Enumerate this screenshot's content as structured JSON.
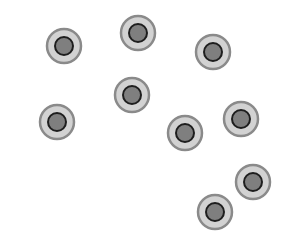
{
  "canvas": {
    "width": 281,
    "height": 238,
    "background": "#ffffff"
  },
  "style": {
    "outer_radius": 17,
    "outer_fill": "#d2d2d2",
    "outer_stroke": "#8a8a8a",
    "outer_stroke_width": 2.5,
    "inner_radius": 9,
    "inner_fill": "#7f7f7f",
    "inner_stroke": "#1e1e1e",
    "inner_stroke_width": 2
  },
  "circles": [
    {
      "id": 1,
      "x": 64,
      "y": 46
    },
    {
      "id": 2,
      "x": 138,
      "y": 33
    },
    {
      "id": 3,
      "x": 213,
      "y": 52
    },
    {
      "id": 4,
      "x": 57,
      "y": 122
    },
    {
      "id": 5,
      "x": 132,
      "y": 95
    },
    {
      "id": 6,
      "x": 185,
      "y": 133
    },
    {
      "id": 7,
      "x": 241,
      "y": 119
    },
    {
      "id": 8,
      "x": 253,
      "y": 182
    },
    {
      "id": 9,
      "x": 215,
      "y": 212
    }
  ]
}
